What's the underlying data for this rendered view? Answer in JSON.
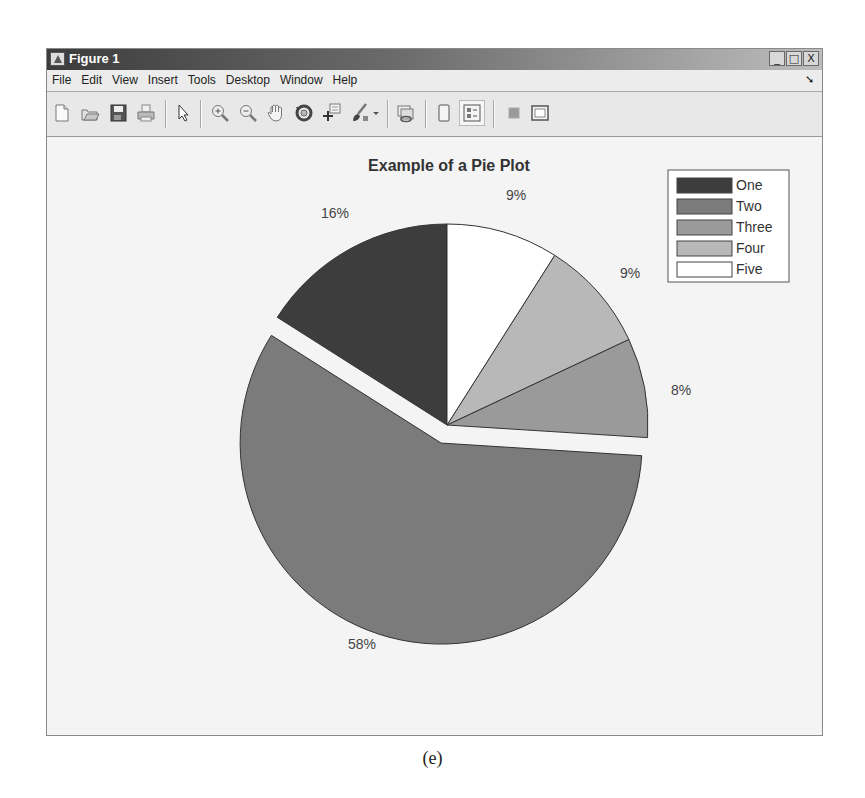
{
  "window": {
    "title": "Figure 1",
    "controls": {
      "minimize": "_",
      "maximize": "□",
      "close": "X"
    }
  },
  "menubar": {
    "items": [
      {
        "label": "File"
      },
      {
        "label": "Edit"
      },
      {
        "label": "View"
      },
      {
        "label": "Insert"
      },
      {
        "label": "Tools"
      },
      {
        "label": "Desktop"
      },
      {
        "label": "Window"
      },
      {
        "label": "Help"
      }
    ],
    "dock_arrow": "➘"
  },
  "toolbar": {
    "buttons": [
      {
        "icon": "new-figure-icon"
      },
      {
        "icon": "open-file-icon"
      },
      {
        "icon": "save-icon"
      },
      {
        "icon": "print-icon"
      },
      {
        "icon": "edit-plot-arrow-icon"
      },
      {
        "icon": "zoom-in-icon"
      },
      {
        "icon": "zoom-out-icon"
      },
      {
        "icon": "pan-hand-icon"
      },
      {
        "icon": "rotate-3d-icon"
      },
      {
        "icon": "data-cursor-icon"
      },
      {
        "icon": "brush-icon"
      },
      {
        "icon": "brush-dropdown-icon"
      },
      {
        "icon": "link-plot-icon"
      },
      {
        "icon": "hide-plot-tools-icon"
      },
      {
        "icon": "show-plot-tools-icon",
        "pressed": true
      },
      {
        "icon": "insert-colorbar-icon"
      },
      {
        "icon": "insert-legend-icon"
      }
    ]
  },
  "caption": "(e)",
  "chart_data": {
    "type": "pie",
    "title": "Example of a Pie Plot",
    "categories": [
      "One",
      "Two",
      "Three",
      "Four",
      "Five"
    ],
    "values": [
      16,
      58,
      8,
      9,
      9
    ],
    "labels": [
      "16%",
      "58%",
      "8%",
      "9%",
      "9%"
    ],
    "colors": [
      "#3d3d3d",
      "#7b7b7b",
      "#9a9a9a",
      "#b8b8b8",
      "#ffffff"
    ],
    "explode": [
      0,
      1,
      0,
      0,
      0
    ],
    "start_angle_deg": 90,
    "direction": "counterclockwise",
    "legend": {
      "position": "northeast",
      "entries": [
        "One",
        "Two",
        "Three",
        "Four",
        "Five"
      ]
    }
  }
}
